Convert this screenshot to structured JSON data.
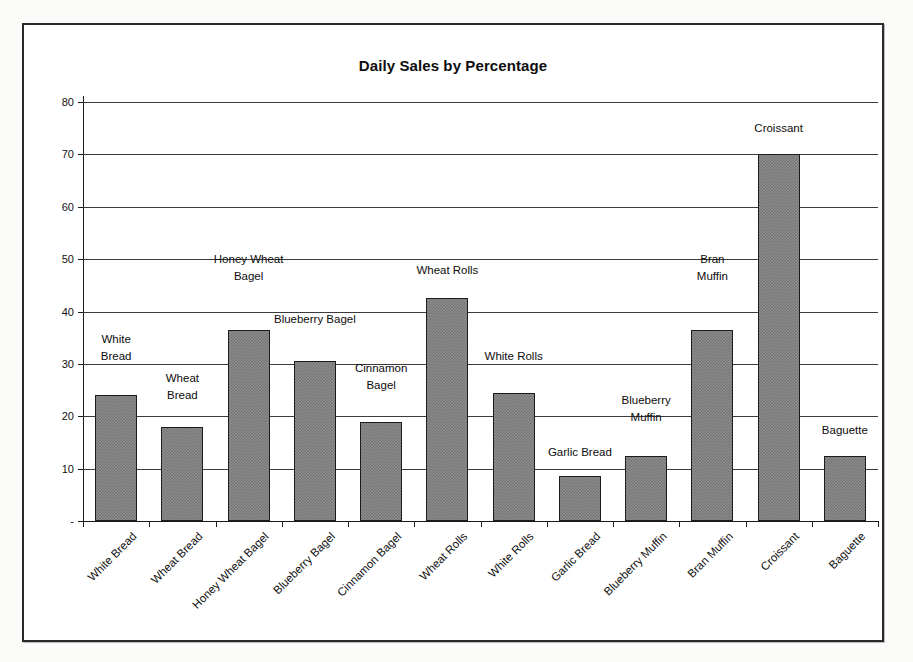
{
  "chart_data": {
    "type": "bar",
    "title": "Daily Sales by Percentage",
    "xlabel": "",
    "ylabel": "",
    "ylim": [
      0,
      80
    ],
    "ytick_labels": [
      "80",
      "70",
      "60",
      "50",
      "40",
      "30",
      "20",
      "10",
      "-"
    ],
    "yticks": [
      80,
      70,
      60,
      50,
      40,
      30,
      20,
      10,
      0
    ],
    "grid": true,
    "legend": "none",
    "bar_color": "#8e8e8e",
    "bar_border_color": "#1c1c1c",
    "categories": [
      "White Bread",
      "Wheat Bread",
      "Honey Wheat Bagel",
      "Blueberry Bagel",
      "Cinnamon Bagel",
      "Wheat Rolls",
      "White Rolls",
      "Garlic Bread",
      "Blueberry Muffin",
      "Bran Muffin",
      "Croissant",
      "Baguette"
    ],
    "values": [
      24,
      18,
      36.5,
      30.5,
      19,
      42.5,
      24.5,
      8.5,
      12.5,
      36.5,
      70,
      12.5
    ],
    "data_labels": [
      "White\nBread",
      "Wheat\nBread",
      "Honey Wheat\nBagel",
      "Blueberry Bagel",
      "Cinnamon\nBagel",
      "Wheat Rolls",
      "White Rolls",
      "Garlic Bread",
      "Blueberry\nMuffin",
      "Bran\nMuffin",
      "Croissant",
      "Baguette"
    ],
    "data_label_offsets": [
      30,
      23,
      45,
      33,
      28,
      19,
      28,
      15,
      30,
      45,
      17,
      17
    ]
  }
}
